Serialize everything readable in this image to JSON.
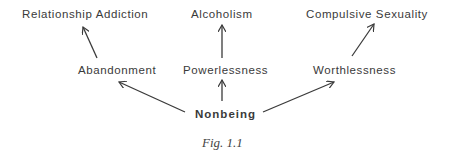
{
  "diagram": {
    "top_row": {
      "left": "Relationship  Addiction",
      "center": "Alcoholism",
      "right": "Compulsive  Sexuality"
    },
    "middle_row": {
      "left": "Abandonment",
      "center": "Powerlessness",
      "right": "Worthlessness"
    },
    "root": "Nonbeing",
    "caption": "Fig. 1.1",
    "edges": [
      {
        "from": "Nonbeing",
        "to": "Abandonment"
      },
      {
        "from": "Nonbeing",
        "to": "Powerlessness"
      },
      {
        "from": "Nonbeing",
        "to": "Worthlessness"
      },
      {
        "from": "Abandonment",
        "to": "Relationship  Addiction"
      },
      {
        "from": "Powerlessness",
        "to": "Alcoholism"
      },
      {
        "from": "Worthlessness",
        "to": "Compulsive  Sexuality"
      }
    ],
    "line_color": "#3a3a3a"
  }
}
